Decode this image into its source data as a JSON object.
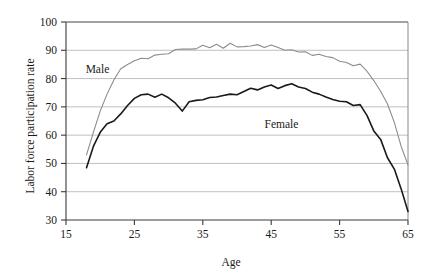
{
  "chart_data": {
    "type": "line",
    "title": "",
    "xlabel": "Age",
    "ylabel": "Labor force participation rate",
    "xlim": [
      15,
      65
    ],
    "ylim": [
      30,
      100
    ],
    "xticks": [
      15,
      25,
      35,
      45,
      55,
      65
    ],
    "yticks": [
      30,
      40,
      50,
      60,
      70,
      80,
      90,
      100
    ],
    "grid": true,
    "legend_position": "inline-annotation",
    "x": [
      18,
      19,
      20,
      21,
      22,
      23,
      24,
      25,
      26,
      27,
      28,
      29,
      30,
      31,
      32,
      33,
      34,
      35,
      36,
      37,
      38,
      39,
      40,
      41,
      42,
      43,
      44,
      45,
      46,
      47,
      48,
      49,
      50,
      51,
      52,
      53,
      54,
      55,
      56,
      57,
      58,
      59,
      60,
      61,
      62,
      63,
      64,
      65
    ],
    "series": [
      {
        "name": "Male",
        "color": "#8c8c8c",
        "values": [
          53.0,
          61.0,
          68.5,
          74.5,
          79.5,
          83.5,
          85.0,
          86.3,
          87.2,
          87.0,
          88.3,
          88.6,
          88.8,
          90.3,
          90.4,
          90.4,
          90.5,
          91.8,
          90.9,
          92.1,
          90.7,
          92.5,
          91.2,
          91.3,
          91.5,
          92.0,
          91.0,
          91.9,
          91.0,
          90.0,
          90.2,
          89.4,
          89.5,
          88.2,
          88.6,
          87.8,
          87.4,
          86.1,
          85.7,
          84.5,
          85.1,
          82.6,
          79.3,
          75.5,
          71.0,
          64.5,
          56.0,
          49.5
        ]
      },
      {
        "name": "Female",
        "color": "#1a1a1a",
        "values": [
          48.5,
          56.0,
          61.0,
          64.0,
          65.0,
          67.5,
          70.5,
          73.0,
          74.3,
          74.5,
          73.4,
          74.5,
          73.2,
          71.3,
          68.5,
          71.8,
          72.3,
          72.5,
          73.3,
          73.5,
          74.0,
          74.5,
          74.3,
          75.4,
          76.6,
          76.0,
          77.0,
          77.7,
          76.5,
          77.5,
          78.2,
          77.0,
          76.5,
          75.2,
          74.5,
          73.5,
          72.6,
          72.0,
          71.8,
          70.5,
          70.8,
          67.0,
          61.5,
          58.5,
          52.0,
          48.0,
          41.0,
          33.0
        ]
      }
    ],
    "annotations": [
      {
        "text": "Male",
        "x": 19.6,
        "y": 82.0
      },
      {
        "text": "Female",
        "x": 46.5,
        "y": 62.5
      }
    ]
  }
}
